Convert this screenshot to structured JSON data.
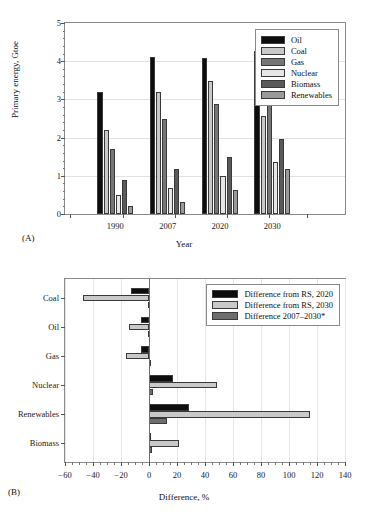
{
  "figure": {
    "panel_a_caption": "(A)",
    "panel_b_caption": "(B)"
  },
  "chart_data": [
    {
      "type": "bar",
      "panel": "(A)",
      "title": "",
      "xlabel": "Year",
      "ylabel": "Primary energy, Gtoe",
      "categories": [
        "1990",
        "2007",
        "2020",
        "2030"
      ],
      "ylim": [
        0,
        5
      ],
      "yticks": [
        0,
        1,
        2,
        3,
        4,
        5
      ],
      "grid": true,
      "legend_position": "top-right",
      "series": [
        {
          "name": "Oil",
          "color": "#0d0d0d",
          "values": [
            3.2,
            4.1,
            4.09,
            4.27
          ]
        },
        {
          "name": "Coal",
          "color": "#c9c9c9",
          "values": [
            2.19,
            3.19,
            3.48,
            2.57
          ]
        },
        {
          "name": "Gas",
          "color": "#767676",
          "values": [
            1.7,
            2.48,
            2.88,
            2.88
          ]
        },
        {
          "name": "Nuclear",
          "color": "#e6e6e6",
          "values": [
            0.5,
            0.68,
            0.99,
            1.37
          ]
        },
        {
          "name": "Biomass",
          "color": "#5a5a5a",
          "values": [
            0.89,
            1.19,
            1.48,
            1.97
          ]
        },
        {
          "name": "Renewables",
          "color": "#9a9a9a",
          "values": [
            0.21,
            0.32,
            0.63,
            1.17
          ]
        }
      ]
    },
    {
      "type": "bar",
      "orientation": "horizontal",
      "panel": "(B)",
      "title": "",
      "xlabel": "Difference, %",
      "ylabel": "",
      "categories": [
        "Coal",
        "Oil",
        "Gas",
        "Nuclear",
        "Renewables",
        "Biomass"
      ],
      "xlim": [
        -60,
        140
      ],
      "xticks": [
        -60,
        -40,
        -20,
        0,
        20,
        40,
        60,
        80,
        100,
        120,
        140
      ],
      "grid": true,
      "legend_position": "top-right",
      "series": [
        {
          "name": "Difference from RS, 2020",
          "color": "#0d0d0d",
          "values": [
            -13.0,
            -6.0,
            -5.5,
            17.0,
            28.5,
            1.5
          ]
        },
        {
          "name": "Difference from RS, 2030",
          "color": "#c9c9c9",
          "values": [
            -47.5,
            -14.0,
            -16.5,
            48.5,
            115.0,
            21.5
          ]
        },
        {
          "name": "Difference 2007–2030*",
          "color": "#6e6e6e",
          "values": [
            -1.0,
            -0.5,
            0.8,
            3.0,
            12.5,
            2.0
          ]
        }
      ]
    }
  ],
  "panel_a": {
    "ylabel": "Primary energy, Gtoe",
    "xlabel": "Year",
    "yticks": [
      "0",
      "1",
      "2",
      "3",
      "4",
      "5"
    ],
    "xticks": [
      "1990",
      "2007",
      "2020",
      "2030"
    ],
    "legend": [
      {
        "label": "Oil",
        "color": "#0d0d0d"
      },
      {
        "label": "Coal",
        "color": "#c9c9c9"
      },
      {
        "label": "Gas",
        "color": "#767676"
      },
      {
        "label": "Nuclear",
        "color": "#e6e6e6"
      },
      {
        "label": "Biomass",
        "color": "#5a5a5a"
      },
      {
        "label": "Renewables",
        "color": "#9a9a9a"
      }
    ]
  },
  "panel_b": {
    "xlabel": "Difference, %",
    "xticks": [
      "−60",
      "−40",
      "−20",
      "0",
      "20",
      "40",
      "60",
      "80",
      "100",
      "120",
      "140"
    ],
    "categories": [
      "Coal",
      "Oil",
      "Gas",
      "Nuclear",
      "Renewables",
      "Biomass"
    ],
    "legend": [
      {
        "label": "Difference from RS, 2020",
        "color": "#0d0d0d"
      },
      {
        "label": "Difference from RS, 2030",
        "color": "#c9c9c9"
      },
      {
        "label": "Difference 2007–2030*",
        "color": "#6e6e6e"
      }
    ]
  }
}
